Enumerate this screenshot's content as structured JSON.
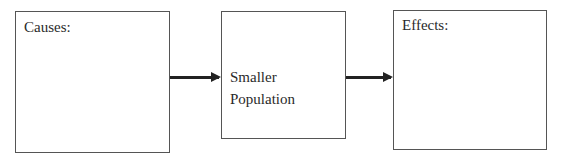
{
  "diagram": {
    "type": "cause-effect flowchart",
    "boxes": [
      {
        "id": "causes",
        "label": "Causes:"
      },
      {
        "id": "center",
        "label_line1": "Smaller",
        "label_line2": "Population"
      },
      {
        "id": "effects",
        "label": "Effects:"
      }
    ],
    "arrows": [
      {
        "from": "causes",
        "to": "center"
      },
      {
        "from": "center",
        "to": "effects"
      }
    ]
  }
}
